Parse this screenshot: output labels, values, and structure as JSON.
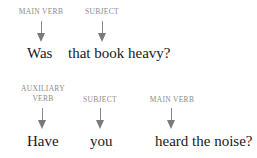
{
  "sentences": [
    {
      "labels": [
        {
          "text": "MAIN VERB"
        },
        {
          "text": "SUBJECT"
        }
      ],
      "words": [
        {
          "text": "Was"
        },
        {
          "text": "that book heavy?"
        }
      ]
    },
    {
      "labels": [
        {
          "line1": "AUXILIARY",
          "line2": "VERB"
        },
        {
          "text": "SUBJECT"
        },
        {
          "text": "MAIN VERB"
        }
      ],
      "words": [
        {
          "text": "Have"
        },
        {
          "text": "you"
        },
        {
          "text": "heard the noise?"
        }
      ]
    }
  ],
  "colors": {
    "label": "#8a8a8a",
    "arrow": "#7a7a7a",
    "word": "#1a1a1a"
  }
}
